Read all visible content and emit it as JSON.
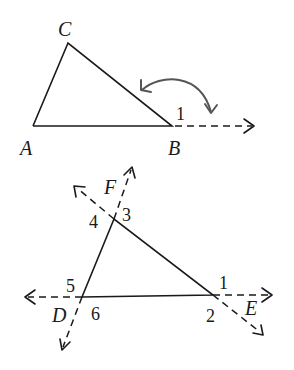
{
  "figure_top": {
    "title": "Triangle ABC with exterior angle 1 at B",
    "vertices": {
      "A": {
        "label": "A"
      },
      "B": {
        "label": "B"
      },
      "C": {
        "label": "C"
      }
    },
    "angle_labels": [
      "1"
    ],
    "annotations": [
      "double-headed curved arrow relating exterior angle 1 to side CB extension"
    ]
  },
  "figure_bottom": {
    "title": "Triangle with extended sides and exterior angles",
    "point_labels": [
      "F",
      "D",
      "E"
    ],
    "angle_labels": {
      "top_vertex": [
        "4",
        "3"
      ],
      "left_vertex": [
        "5",
        "6"
      ],
      "right_vertex": [
        "1",
        "2"
      ]
    }
  },
  "colors": {
    "stroke": "#1a1a1a",
    "curve_arrow": "#555555",
    "background": "#ffffff"
  }
}
